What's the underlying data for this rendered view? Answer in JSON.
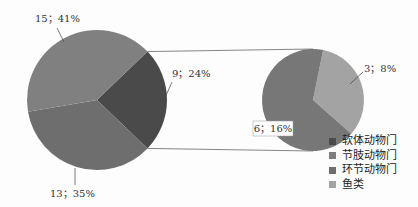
{
  "chart_data": {
    "type": "pie",
    "subtype": "pie-of-pie",
    "title": "",
    "main_pie": {
      "slices": [
        {
          "name": "软体动物门",
          "value": 9,
          "percent": 24,
          "label": "9；24%",
          "color": "#4a4a4a",
          "split_out": true
        },
        {
          "name": "环节动物门",
          "value": 13,
          "percent": 35,
          "label": "13；35%",
          "color": "#6e6e6e"
        },
        {
          "name": "节肢动物门",
          "value": 15,
          "percent": 41,
          "label": "15；41%",
          "color": "#808080"
        }
      ]
    },
    "secondary_pie": {
      "slices": [
        {
          "name": "节肢动物门",
          "value": 6,
          "percent": 16,
          "label": "6；16%",
          "color": "#777777"
        },
        {
          "name": "鱼类",
          "value": 3,
          "percent": 8,
          "label": "3；8%",
          "color": "#a3a3a3"
        }
      ]
    },
    "legend": {
      "position": "bottom-right",
      "entries": [
        {
          "label": "软体动物门",
          "color": "#4a4a4a"
        },
        {
          "label": "节肢动物门",
          "color": "#7d7d7d"
        },
        {
          "label": "环节动物门",
          "color": "#6e6e6e"
        },
        {
          "label": "鱼类",
          "color": "#a3a3a3"
        }
      ]
    }
  }
}
